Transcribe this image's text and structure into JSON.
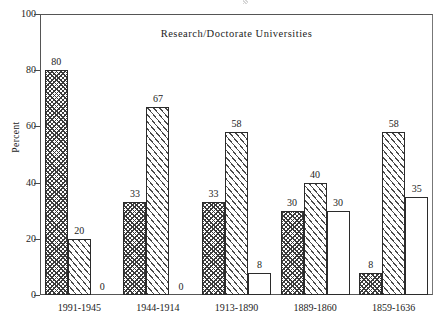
{
  "chart_data": {
    "type": "bar",
    "title": "Research/Doctorate  Universities",
    "xlabel": "",
    "ylabel": "Percent",
    "ylim": [
      0,
      100
    ],
    "yticks": [
      0,
      20,
      40,
      60,
      80,
      100
    ],
    "grid": false,
    "legend": "none",
    "categories": [
      "1991-1945",
      "1944-1914",
      "1913-1890",
      "1889-1860",
      "1859-1636"
    ],
    "series": [
      {
        "name": "series-1",
        "pattern": "crosshatch",
        "values": [
          80,
          33,
          33,
          30,
          8
        ]
      },
      {
        "name": "series-2",
        "pattern": "diagonal-hatch",
        "values": [
          20,
          67,
          58,
          40,
          58
        ]
      },
      {
        "name": "series-3",
        "pattern": "solid-white",
        "values": [
          0,
          0,
          8,
          30,
          35
        ]
      }
    ],
    "value_labels": [
      [
        "80",
        "20",
        "0"
      ],
      [
        "33",
        "67",
        "0"
      ],
      [
        "33",
        "58",
        "8"
      ],
      [
        "30",
        "40",
        "30"
      ],
      [
        "8",
        "58",
        "35"
      ]
    ],
    "colors": {
      "axis": "#555555",
      "bar_outline": "#2b2b2b",
      "hatch": "#3b3b3b",
      "background": "#ffffff",
      "text": "#1c1c1c"
    }
  }
}
